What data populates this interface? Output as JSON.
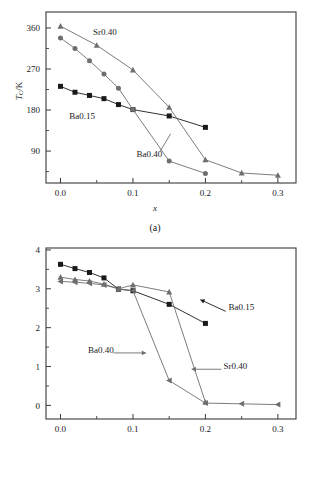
{
  "figure": {
    "panels": [
      {
        "id": "a",
        "caption": "(a)",
        "xlabel": "x",
        "ylabel_main": "T",
        "ylabel_sub": "C",
        "ylabel_rest": "/K"
      },
      {
        "id": "b",
        "caption": "(b)",
        "xlabel": "x",
        "ylabel_main": "μ",
        "ylabel_sub": "obs",
        "ylabel_rest": "/ μ",
        "ylabel_sub2": "B"
      }
    ]
  },
  "chart_data": [
    {
      "type": "line",
      "panel": "a",
      "title": "",
      "xlabel": "x",
      "ylabel": "TC/K",
      "xlim": [
        -0.02,
        0.325
      ],
      "ylim": [
        20,
        395
      ],
      "xticks": [
        0.0,
        0.1,
        0.2,
        0.3
      ],
      "xticklabels": [
        "0.0",
        "0.1",
        "0.2",
        "0.3"
      ],
      "xminorticks": [
        0.05,
        0.15,
        0.25
      ],
      "yticks": [
        90,
        180,
        270,
        360
      ],
      "yticklabels": [
        "90",
        "180",
        "270",
        "360"
      ],
      "yminorticks": [
        45,
        135,
        225,
        315
      ],
      "grid": false,
      "legend": "inline-annotations",
      "series": [
        {
          "name": "Ba0.15",
          "marker": "square",
          "color": "#1a1a1a",
          "x": [
            0.0,
            0.02,
            0.04,
            0.06,
            0.08,
            0.1,
            0.15,
            0.2
          ],
          "y": [
            232,
            219,
            212,
            205,
            192,
            181,
            167,
            142
          ]
        },
        {
          "name": "Sr0.40",
          "marker": "triangle-up",
          "color": "#6e6e6e",
          "x": [
            0.0,
            0.05,
            0.1,
            0.15,
            0.2,
            0.25,
            0.3
          ],
          "y": [
            364,
            322,
            268,
            186,
            71,
            42,
            37
          ]
        },
        {
          "name": "Ba0.40",
          "marker": "circle",
          "color": "#6e6e6e",
          "x": [
            0.0,
            0.02,
            0.04,
            0.06,
            0.08,
            0.1,
            0.15,
            0.2
          ],
          "y": [
            338,
            315,
            288,
            259,
            228,
            181,
            68,
            41
          ]
        }
      ],
      "annotations": [
        {
          "text": "Sr0.40",
          "x": 0.045,
          "y": 345
        },
        {
          "text": "Ba0.15",
          "x": 0.012,
          "y": 160
        },
        {
          "text": "Ba0.40",
          "x": 0.105,
          "y": 78
        }
      ]
    },
    {
      "type": "line",
      "panel": "b",
      "title": "",
      "xlabel": "x",
      "ylabel": "μobs/μB",
      "xlim": [
        -0.02,
        0.325
      ],
      "ylim": [
        -0.35,
        4.05
      ],
      "xticks": [
        0.0,
        0.1,
        0.2,
        0.3
      ],
      "xticklabels": [
        "0.0",
        "0.1",
        "0.2",
        "0.3"
      ],
      "xminorticks": [
        0.05,
        0.15,
        0.25
      ],
      "yticks": [
        0,
        1,
        2,
        3,
        4
      ],
      "yticklabels": [
        "0",
        "1",
        "2",
        "3",
        "4"
      ],
      "yminorticks": [
        0.5,
        1.5,
        2.5,
        3.5
      ],
      "grid": false,
      "legend": "inline-annotations-with-arrows",
      "series": [
        {
          "name": "Ba0.15",
          "marker": "square",
          "color": "#1a1a1a",
          "x": [
            0.0,
            0.02,
            0.04,
            0.06,
            0.08,
            0.1,
            0.15,
            0.2
          ],
          "y": [
            3.63,
            3.52,
            3.42,
            3.28,
            2.99,
            2.95,
            2.6,
            2.11
          ]
        },
        {
          "name": "Sr0.40",
          "marker": "triangle-up",
          "color": "#6e6e6e",
          "x": [
            0.0,
            0.02,
            0.04,
            0.06,
            0.08,
            0.1,
            0.15,
            0.2
          ],
          "y": [
            3.3,
            3.24,
            3.2,
            3.12,
            3.0,
            3.1,
            2.92,
            0.08
          ]
        },
        {
          "name": "Ba0.40",
          "marker": "triangle-left",
          "color": "#6e6e6e",
          "x": [
            0.0,
            0.02,
            0.04,
            0.06,
            0.08,
            0.1,
            0.15,
            0.2,
            0.25,
            0.3
          ],
          "y": [
            3.19,
            3.17,
            3.14,
            3.1,
            3.0,
            2.95,
            0.64,
            0.06,
            0.04,
            0.02
          ]
        }
      ],
      "annotations": [
        {
          "text": "Ba0.15",
          "x": 0.232,
          "y": 2.45
        },
        {
          "text": "Ba0.40",
          "x": 0.038,
          "y": 1.35
        },
        {
          "text": "Sr0.40",
          "x": 0.225,
          "y": 0.93
        }
      ]
    }
  ]
}
